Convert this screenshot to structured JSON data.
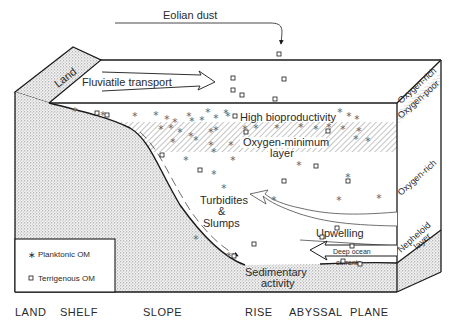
{
  "diagram": {
    "top_labels": {
      "eolian_dust": "Eolian dust",
      "land": "Land",
      "fluviatile_transport": "Fluviatile transport"
    },
    "water_labels": {
      "high_bioproductivity": "High bioproductivity",
      "oxygen_minimum_line1": "Oxygen-minimum",
      "oxygen_minimum_line2": "layer",
      "turbidites_line1": "Turbidites",
      "turbidites_line2": "&",
      "turbidites_line3": "Slumps",
      "upwelling": "Upwelling",
      "deep_ocean_line1": "Deep ocean",
      "deep_ocean_line2": "currents",
      "sedimentary_line1": "Sedimentary",
      "sedimentary_line2": "activity"
    },
    "side_labels": {
      "oxygen_rich_top": "Oxygen-rich",
      "oxygen_poor": "Oxygen-poor",
      "oxygen_rich_mid": "Oxygen-rich",
      "nepheloid_line1": "Nepheloid",
      "nepheloid_line2": "layer"
    },
    "legend": {
      "items": [
        {
          "symbol": "asterisk",
          "label": "Planktonic OM"
        },
        {
          "symbol": "square",
          "label": "Terrigenous OM"
        }
      ]
    },
    "zones": [
      "LAND",
      "SHELF",
      "SLOPE",
      "RISE",
      "ABYSSAL",
      "PLANE"
    ],
    "colors": {
      "line": "#1a1a1a",
      "stipple": "#9a9a9a",
      "hatch": "#8a8a8a",
      "text": "#2a2a2a"
    }
  }
}
